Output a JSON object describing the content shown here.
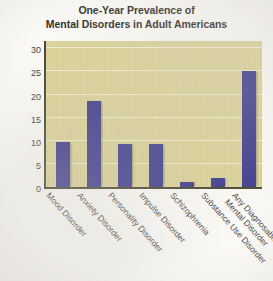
{
  "chart_data": {
    "type": "bar",
    "title": "One-Year Prevalence of Mental Disorders in Adult Americans",
    "title_lines": [
      "One-Year Prevalence of",
      "Mental Disorders in Adult Americans"
    ],
    "xlabel": "",
    "ylabel": "",
    "ylim": [
      0,
      32
    ],
    "yticks": [
      0,
      5,
      10,
      15,
      20,
      25,
      30
    ],
    "grid": true,
    "legend": "none",
    "categories": [
      "Mood Disorder",
      "Anxiety Disorder",
      "Personality Disorder",
      "Impulse Disorder",
      "Schizophrenia",
      "Substance Use Disorder",
      "Any Diagnosable Mental Disorder"
    ],
    "category_lines": [
      [
        "Mood Disorder"
      ],
      [
        "Anxiety Disorder"
      ],
      [
        "Personality Disorder"
      ],
      [
        "Impulse Disorder"
      ],
      [
        "Schizophrenia"
      ],
      [
        "Substance Use Disorder"
      ],
      [
        "Any Diagnosable",
        "Mental Disorder"
      ]
    ],
    "values": [
      9.7,
      18.7,
      9.3,
      9.2,
      1.1,
      2.0,
      25.1
    ],
    "colors": {
      "bar": "#3d3c8e",
      "plot_background": "#d9d094",
      "gridline": "#f2ecd0",
      "axis": "#4a4530",
      "title_text": "#2f2b28",
      "tick_text": "#484240",
      "page_background": "#fbfaf7"
    }
  }
}
